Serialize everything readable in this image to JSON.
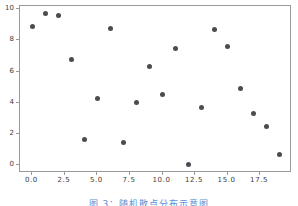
{
  "figure": {
    "background_color": "#ffffff",
    "frame_color": "#9a9a9a",
    "marker_color": "#4b4b52",
    "caption_color": "#5b8fd4",
    "caption": "图 3：随机散点分布示意图"
  },
  "chart_data": {
    "type": "scatter",
    "title": "",
    "xlabel": "",
    "ylabel": "",
    "xlim": [
      -0.95,
      19.95
    ],
    "ylim": [
      -0.5,
      10.2
    ],
    "grid": false,
    "legend": null,
    "xticks": [
      0.0,
      2.5,
      5.0,
      7.5,
      10.0,
      12.5,
      15.0,
      17.5
    ],
    "xticklabels": [
      "0.0",
      "2.5",
      "5.0",
      "7.5",
      "10.0",
      "12.5",
      "15.0",
      "17.5"
    ],
    "yticks": [
      0,
      2,
      4,
      6,
      8,
      10
    ],
    "yticklabels": [
      "0",
      "2",
      "4",
      "6",
      "8",
      "10"
    ],
    "marker": "circle",
    "marker_size": 5,
    "series": [
      {
        "name": "points",
        "color": "#4b4b52",
        "x": [
          0,
          1,
          2,
          3,
          4,
          5,
          6,
          7,
          8,
          9,
          10,
          11,
          12,
          13,
          14,
          15,
          16,
          17,
          18,
          19
        ],
        "y": [
          8.88,
          9.75,
          9.58,
          6.78,
          1.63,
          4.25,
          8.78,
          1.43,
          4.02,
          6.33,
          4.5,
          7.5,
          0.05,
          3.68,
          8.67,
          7.63,
          4.93,
          3.32,
          2.45,
          0.7
        ]
      }
    ]
  }
}
